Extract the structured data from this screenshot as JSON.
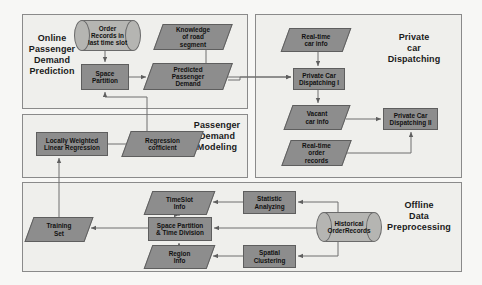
{
  "diagram": {
    "colors": {
      "canvas_background": "#f7f7f5",
      "panel_background": "#efefec",
      "panel_border": "#8a8a8a",
      "process_fill": "#8d8d8d",
      "process_border": "#5e5e5e",
      "data_fill": "#8d8d8d",
      "store_fill": "#b5b5b2",
      "edge_color": "#6f6f6f",
      "text_color": "#111111"
    },
    "panels": [
      {
        "id": "online-passenger-demand-prediction",
        "title": "Online\nPassenger\nDemand\nPrediction",
        "x": 22,
        "y": 14,
        "w": 226,
        "h": 95
      },
      {
        "id": "passenger-demand-modeling",
        "title": "Passenger\nDemand\nModeling",
        "x": 22,
        "y": 114,
        "w": 226,
        "h": 64
      },
      {
        "id": "private-car-dispatching",
        "title": "Private\ncar\nDispatching",
        "x": 255,
        "y": 14,
        "w": 207,
        "h": 164
      },
      {
        "id": "offline-data-preprocessing",
        "title": "Offline\nData\nPreprocessing",
        "x": 22,
        "y": 182,
        "w": 440,
        "h": 90
      }
    ],
    "nodes": [
      {
        "id": "order-records",
        "label": "Order\nRecords in\nlast time slot",
        "shape": "cylinder",
        "x": 74,
        "y": 20,
        "w": 67,
        "h": 31,
        "font": 6.4
      },
      {
        "id": "knowledge-road",
        "label": "Knowledge\nof road\nsegment",
        "shape": "parallelogram",
        "x": 158,
        "y": 24,
        "w": 70,
        "h": 26,
        "font": 6.4
      },
      {
        "id": "space-partition",
        "label": "Space\nPartition",
        "shape": "process",
        "x": 81,
        "y": 64,
        "w": 48,
        "h": 26,
        "font": 6.4
      },
      {
        "id": "predicted-demand",
        "label": "Predicted\nPassenger\nDemand",
        "shape": "parallelogram",
        "x": 148,
        "y": 63,
        "w": 80,
        "h": 27,
        "font": 6.4
      },
      {
        "id": "locally-weighted",
        "label": "Locally Weighted\nLinear Regression",
        "shape": "process",
        "x": 36,
        "y": 132,
        "w": 72,
        "h": 24,
        "font": 6.4
      },
      {
        "id": "regression-coeff",
        "label": "Regression\ncofficient",
        "shape": "parallelogram",
        "x": 126,
        "y": 131,
        "w": 73,
        "h": 26,
        "font": 6.4
      },
      {
        "id": "realtime-car-info",
        "label": "Real-time\ncar info",
        "shape": "parallelogram",
        "x": 285,
        "y": 28,
        "w": 62,
        "h": 24,
        "font": 6.4
      },
      {
        "id": "dispatching-1",
        "label": "Private Car\nDispatching I",
        "shape": "process",
        "x": 293,
        "y": 68,
        "w": 52,
        "h": 22,
        "font": 6.4
      },
      {
        "id": "vacant-car-info",
        "label": "Vacant\ncar info",
        "shape": "parallelogram",
        "x": 288,
        "y": 105,
        "w": 58,
        "h": 25,
        "font": 6.4
      },
      {
        "id": "dispatching-2",
        "label": "Private Car\nDispatching II",
        "shape": "process",
        "x": 383,
        "y": 108,
        "w": 55,
        "h": 22,
        "font": 6.4
      },
      {
        "id": "realtime-order",
        "label": "Real-time\norder\nrecords",
        "shape": "parallelogram",
        "x": 286,
        "y": 140,
        "w": 61,
        "h": 26,
        "font": 6.4
      },
      {
        "id": "timeslot-info",
        "label": "TimeSlot\nInfo",
        "shape": "parallelogram",
        "x": 148,
        "y": 191,
        "w": 63,
        "h": 24,
        "font": 6.4
      },
      {
        "id": "statistic-analyzing",
        "label": "Statistic\nAnalyzing",
        "shape": "process",
        "x": 243,
        "y": 191,
        "w": 53,
        "h": 23,
        "font": 6.4
      },
      {
        "id": "training-set",
        "label": "Training\nSet",
        "shape": "parallelogram",
        "x": 29,
        "y": 217,
        "w": 60,
        "h": 25,
        "font": 6.4
      },
      {
        "id": "space-time-division",
        "label": "Space Partition\n& Time Division",
        "shape": "process",
        "x": 148,
        "y": 217,
        "w": 64,
        "h": 24,
        "font": 6.4
      },
      {
        "id": "historical-records",
        "label": "Historical\nOrderRecords",
        "shape": "cylinder",
        "x": 316,
        "y": 212,
        "w": 66,
        "h": 30,
        "font": 6.4
      },
      {
        "id": "region-info",
        "label": "Region\nInfo",
        "shape": "parallelogram",
        "x": 148,
        "y": 245,
        "w": 63,
        "h": 24,
        "font": 6.4
      },
      {
        "id": "spatial-clustering",
        "label": "Spatial\nClustering",
        "shape": "process",
        "x": 243,
        "y": 245,
        "w": 53,
        "h": 23,
        "font": 6.4
      }
    ],
    "edges": [
      {
        "id": "order-records-to-space-partition",
        "from": "order-records",
        "to": "space-partition"
      },
      {
        "id": "space-partition-to-predicted-demand",
        "from": "space-partition",
        "to": "predicted-demand"
      },
      {
        "id": "knowledge-road-to-dispatching-1",
        "from": "knowledge-road",
        "to": "dispatching-1"
      },
      {
        "id": "predicted-demand-to-dispatching-1",
        "from": "predicted-demand",
        "to": "dispatching-1"
      },
      {
        "id": "regression-coeff-to-space-partition",
        "from": "regression-coeff",
        "to": "space-partition"
      },
      {
        "id": "locally-weighted-to-regression-coeff",
        "from": "locally-weighted",
        "to": "regression-coeff"
      },
      {
        "id": "training-set-to-locally-weighted",
        "from": "training-set",
        "to": "locally-weighted"
      },
      {
        "id": "realtime-car-info-to-dispatching-1",
        "from": "realtime-car-info",
        "to": "dispatching-1"
      },
      {
        "id": "dispatching-1-to-vacant-car-info",
        "from": "dispatching-1",
        "to": "vacant-car-info"
      },
      {
        "id": "vacant-car-info-to-dispatching-2",
        "from": "vacant-car-info",
        "to": "dispatching-2"
      },
      {
        "id": "realtime-order-to-dispatching-2",
        "from": "realtime-order",
        "to": "dispatching-2"
      },
      {
        "id": "historical-records-to-statistic-analyzing",
        "from": "historical-records",
        "to": "statistic-analyzing"
      },
      {
        "id": "historical-records-to-space-time-division",
        "from": "historical-records",
        "to": "space-time-division"
      },
      {
        "id": "historical-records-to-spatial-clustering",
        "from": "historical-records",
        "to": "spatial-clustering"
      },
      {
        "id": "statistic-analyzing-to-timeslot-info",
        "from": "statistic-analyzing",
        "to": "timeslot-info"
      },
      {
        "id": "spatial-clustering-to-region-info",
        "from": "spatial-clustering",
        "to": "region-info"
      },
      {
        "id": "timeslot-info-to-space-time-division",
        "from": "timeslot-info",
        "to": "space-time-division"
      },
      {
        "id": "region-info-to-space-time-division",
        "from": "region-info",
        "to": "space-time-division"
      },
      {
        "id": "space-time-division-to-training-set",
        "from": "space-time-division",
        "to": "training-set"
      }
    ]
  }
}
